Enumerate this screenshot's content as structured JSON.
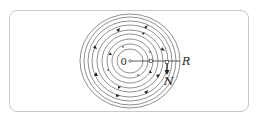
{
  "diagram": {
    "type": "concentric-circle-field",
    "center_label": "0",
    "radius_label": "R",
    "vector_label": "N",
    "ring_count": 9,
    "colors": {
      "stroke": "#333333",
      "frame": "#c8c8c8",
      "background": "#ffffff"
    }
  }
}
